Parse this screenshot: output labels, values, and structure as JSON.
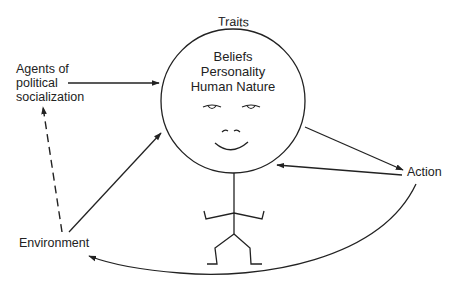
{
  "diagram": {
    "head_label": "Traits",
    "head_lines": [
      "Beliefs",
      "Personality",
      "Human Nature"
    ],
    "nodes": {
      "agents": [
        "Agents of",
        "political",
        "socialization"
      ],
      "environment": "Environment",
      "action": "Action"
    },
    "edges": [
      {
        "from": "Agents of political socialization",
        "to": "Traits",
        "style": "solid"
      },
      {
        "from": "Environment",
        "to": "Traits",
        "style": "solid"
      },
      {
        "from": "Environment",
        "to": "Agents of political socialization",
        "style": "dashed"
      },
      {
        "from": "Traits",
        "to": "Action",
        "style": "solid"
      },
      {
        "from": "Action",
        "to": "Traits",
        "style": "solid"
      },
      {
        "from": "Action",
        "to": "Environment",
        "style": "solid-curved"
      }
    ],
    "colors": {
      "line": "#222222",
      "background": "#ffffff"
    }
  }
}
